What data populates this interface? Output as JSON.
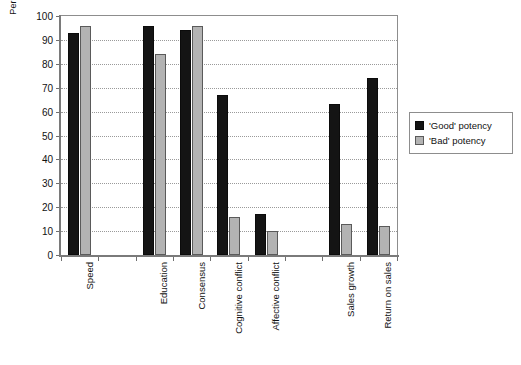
{
  "chart_data": {
    "type": "bar",
    "title": "",
    "xlabel": "",
    "ylabel": "Percentile rank for total sample",
    "ylim": [
      0,
      100
    ],
    "yticks": [
      0,
      10,
      20,
      30,
      40,
      50,
      60,
      70,
      80,
      90,
      100
    ],
    "grid": true,
    "legend_position": "right",
    "categories": [
      "Speed",
      "",
      "Education",
      "Consensus",
      "Cognitive conflict",
      "Affective conflict",
      "",
      "Sales growth",
      "Return on sales"
    ],
    "series": [
      {
        "name": "'Good' potency",
        "color": "#141414",
        "values": [
          93,
          null,
          96,
          94,
          67,
          17,
          null,
          63,
          74
        ]
      },
      {
        "name": "'Bad' potency",
        "color": "#b3b3b3",
        "values": [
          96,
          null,
          84,
          96,
          16,
          10,
          null,
          13,
          12
        ]
      }
    ]
  },
  "legend": {
    "items": [
      {
        "label": "'Good' potency",
        "swatch": "good"
      },
      {
        "label": "'Bad' potency",
        "swatch": "bad"
      }
    ]
  },
  "colors": {
    "good": "#141414",
    "bad": "#b3b3b3",
    "axis": "#7a7a7a",
    "grid": "#9a9a9a",
    "background": "#ffffff"
  }
}
